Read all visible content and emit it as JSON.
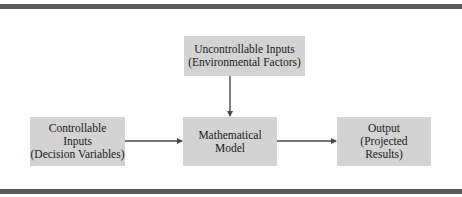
{
  "diagram": {
    "type": "flowchart",
    "colors": {
      "box_fill": "#d3d3d3",
      "rule": "#5a5a5a",
      "arrow": "#4a4a4a",
      "text": "#1a1a1a"
    },
    "nodes": {
      "uncontrollable": {
        "lines": [
          "Uncontrollable Inputs",
          "(Environmental Factors)"
        ]
      },
      "controllable": {
        "lines": [
          "Controllable",
          "Inputs",
          "(Decision Variables)"
        ]
      },
      "model": {
        "lines": [
          "Mathematical",
          "Model"
        ]
      },
      "output": {
        "lines": [
          "Output",
          "(Projected",
          "Results)"
        ]
      }
    },
    "edges": [
      {
        "from": "uncontrollable",
        "to": "model"
      },
      {
        "from": "controllable",
        "to": "model"
      },
      {
        "from": "model",
        "to": "output"
      }
    ]
  }
}
